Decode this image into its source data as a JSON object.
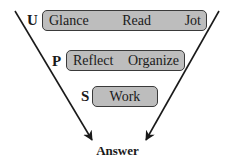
{
  "diagram": {
    "type": "funnel-flow",
    "stages": [
      {
        "letter": "U",
        "steps": [
          "Glance",
          "Read",
          "Jot"
        ]
      },
      {
        "letter": "P",
        "steps": [
          "Reflect",
          "Organize"
        ]
      },
      {
        "letter": "S",
        "steps": [
          "Work"
        ]
      }
    ],
    "outcome": "Answer",
    "colors": {
      "box_fill": "#bdbdbd",
      "box_border": "#3a3a3a",
      "line": "#1a1a1a"
    }
  }
}
